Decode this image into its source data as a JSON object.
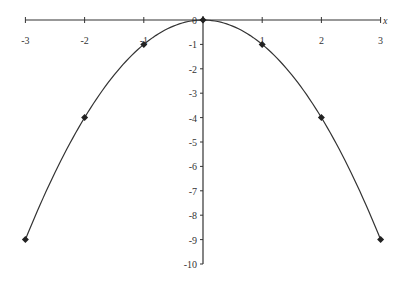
{
  "chart_data": {
    "type": "line",
    "title": "",
    "xlabel": "x",
    "ylabel": "",
    "function": "y = -x^2",
    "x": [
      -3,
      -2,
      -1,
      0,
      1,
      2,
      3
    ],
    "series": [
      {
        "name": "y = -x^2",
        "values": [
          -9,
          -4,
          -1,
          0,
          -1,
          -4,
          -9
        ],
        "marker": "diamond",
        "smooth": true
      }
    ],
    "xlim": [
      -3,
      3
    ],
    "ylim": [
      -10,
      0
    ],
    "x_ticks": [
      "-3",
      "-2",
      "-1",
      "0",
      "1",
      "2",
      "3"
    ],
    "y_ticks": [
      "0",
      "-1",
      "-2",
      "-3",
      "-4",
      "-5",
      "-6",
      "-7",
      "-8",
      "-9",
      "-10"
    ],
    "grid": false,
    "legend": null
  },
  "axis": {
    "x_label": "x"
  },
  "colors": {
    "line": "#333333",
    "marker": "#222222",
    "axis": "#333333"
  }
}
